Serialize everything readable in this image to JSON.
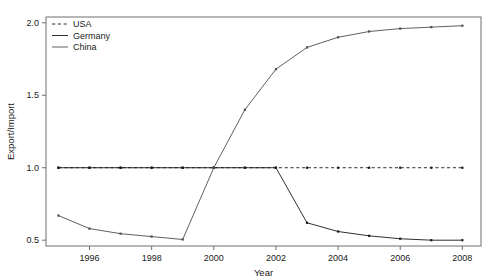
{
  "chart_data": {
    "type": "line",
    "title": "",
    "xlabel": "Year",
    "ylabel": "Export/Import",
    "xlim": [
      1994.6,
      2008.6
    ],
    "ylim": [
      0.46,
      2.04
    ],
    "grid": false,
    "legend_position": "top-left",
    "x_ticks": [
      1996,
      1998,
      2000,
      2002,
      2004,
      2006,
      2008
    ],
    "x_tick_labels": [
      "1996",
      "1998",
      "2000",
      "2002",
      "2004",
      "2006",
      "2008"
    ],
    "y_ticks": [
      0.5,
      1.0,
      1.5,
      2.0
    ],
    "y_tick_labels": [
      "0.5",
      "1.0",
      "1.5",
      "2.0"
    ],
    "x": [
      1995,
      1996,
      1997,
      1998,
      1999,
      2000,
      2001,
      2002,
      2003,
      2004,
      2005,
      2006,
      2007,
      2008
    ],
    "series": [
      {
        "name": "USA",
        "style": "dashed",
        "color": "#1a1a1a",
        "values": [
          1.0,
          1.0,
          1.0,
          1.0,
          1.0,
          1.0,
          1.0,
          1.0,
          1.0,
          1.0,
          1.0,
          1.0,
          1.0,
          1.0
        ]
      },
      {
        "name": "Germany",
        "style": "solid",
        "color": "#1a1a1a",
        "values": [
          1.0,
          1.0,
          1.0,
          1.0,
          1.0,
          1.0,
          1.0,
          1.0,
          0.62,
          0.56,
          0.53,
          0.51,
          0.5,
          0.5
        ]
      },
      {
        "name": "China",
        "style": "solid",
        "color": "#4d4d4d",
        "values": [
          0.67,
          0.58,
          0.545,
          0.525,
          0.505,
          1.0,
          1.4,
          1.68,
          1.83,
          1.9,
          1.94,
          1.96,
          1.97,
          1.98
        ]
      }
    ]
  },
  "legend": {
    "entries": [
      {
        "label": "USA"
      },
      {
        "label": "Germany"
      },
      {
        "label": "China"
      }
    ]
  },
  "axes": {
    "x_title": "Year",
    "y_title": "Export/Import"
  }
}
